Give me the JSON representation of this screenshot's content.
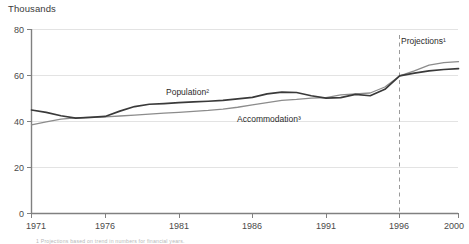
{
  "chart_data": {
    "type": "line",
    "title": "",
    "unit_label": "Thousands",
    "xlabel": "",
    "ylabel": "",
    "ylim": [
      0,
      80
    ],
    "xlim": [
      1971,
      2000
    ],
    "yticks": [
      0,
      20,
      40,
      60,
      80
    ],
    "xticks": [
      1971,
      1976,
      1981,
      1986,
      1991,
      1996,
      2000
    ],
    "grid": "horizontal",
    "legend": "inline-labels",
    "annotations": [
      {
        "name": "projections-divider",
        "label": "Projections¹",
        "x": 1996,
        "style": "dashed-vertical"
      }
    ],
    "x": [
      1971,
      1972,
      1973,
      1974,
      1975,
      1976,
      1977,
      1978,
      1979,
      1980,
      1981,
      1982,
      1983,
      1984,
      1985,
      1986,
      1987,
      1988,
      1989,
      1990,
      1991,
      1992,
      1993,
      1994,
      1995,
      1996,
      1997,
      1998,
      1999,
      2000
    ],
    "series": [
      {
        "name": "Population²",
        "label": "Population²",
        "color": "#3a3a3a",
        "values": [
          45,
          44,
          42.5,
          41.5,
          41.8,
          42.2,
          44.5,
          46.5,
          47.5,
          47.8,
          48.2,
          48.5,
          48.8,
          49.2,
          49.8,
          50.5,
          52.0,
          52.8,
          52.6,
          51.2,
          50.2,
          50.4,
          51.8,
          51.2,
          54.0,
          59.8,
          61.0,
          62.0,
          62.6,
          63.0
        ]
      },
      {
        "name": "Accommodation³",
        "label": "Accommodation³",
        "color": "#8c8c8c",
        "values": [
          38.5,
          39.8,
          41.0,
          41.6,
          41.8,
          42.0,
          42.4,
          42.8,
          43.2,
          43.6,
          44.0,
          44.4,
          44.8,
          45.4,
          46.2,
          47.2,
          48.2,
          49.2,
          49.6,
          50.2,
          50.4,
          51.6,
          52.0,
          52.4,
          55.0,
          59.8,
          62.0,
          64.5,
          65.6,
          66.0
        ]
      }
    ]
  },
  "footnote": {
    "text": "1 Projections based on trend in numbers for financial years."
  },
  "axes": {
    "y_tick_labels": [
      "0",
      "20",
      "40",
      "60",
      "80"
    ],
    "x_tick_labels": [
      "1971",
      "1976",
      "1981",
      "1986",
      "1991",
      "1996",
      "2000"
    ]
  }
}
